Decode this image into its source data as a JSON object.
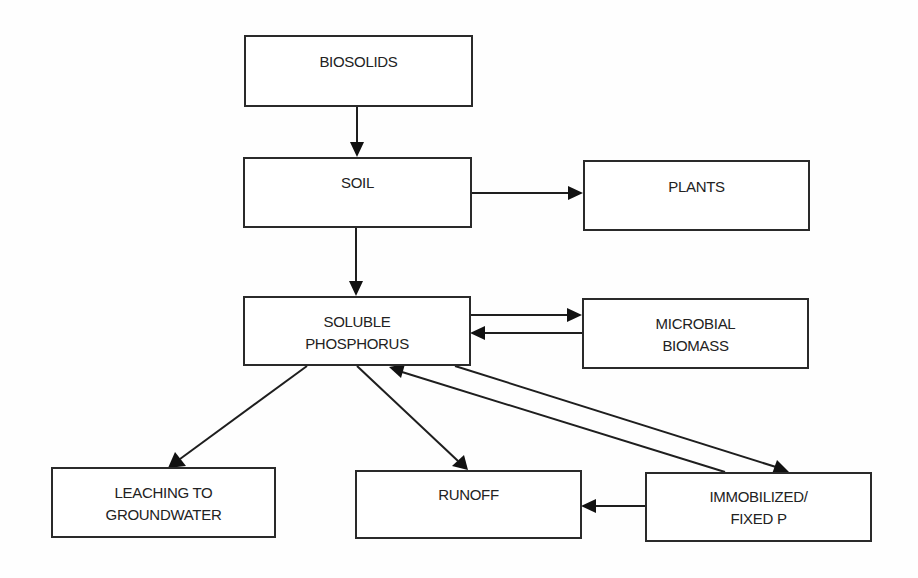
{
  "diagram": {
    "type": "flowchart",
    "title": "",
    "colors": {
      "stroke": "#1e1e1e",
      "fill": "#ffffff",
      "text": "#222222"
    },
    "nodes": {
      "biosolids": {
        "label": "BIOSOLIDS"
      },
      "soil": {
        "label": "SOIL"
      },
      "plants": {
        "label": "PLANTS"
      },
      "soluble_p": {
        "label": "SOLUBLE\nPHOSPHORUS"
      },
      "microbial": {
        "label": "MICROBIAL\nBIOMASS"
      },
      "leaching": {
        "label": "LEACHING TO\nGROUNDWATER"
      },
      "runoff": {
        "label": "RUNOFF"
      },
      "immobilized": {
        "label": "IMMOBILIZED/\nFIXED  P"
      }
    },
    "edges": [
      {
        "from": "biosolids",
        "to": "soil"
      },
      {
        "from": "soil",
        "to": "plants"
      },
      {
        "from": "soil",
        "to": "soluble_p"
      },
      {
        "from": "soluble_p",
        "to": "microbial"
      },
      {
        "from": "microbial",
        "to": "soluble_p"
      },
      {
        "from": "soluble_p",
        "to": "leaching"
      },
      {
        "from": "soluble_p",
        "to": "runoff"
      },
      {
        "from": "soluble_p",
        "to": "immobilized"
      },
      {
        "from": "immobilized",
        "to": "soluble_p"
      },
      {
        "from": "immobilized",
        "to": "runoff"
      }
    ]
  }
}
